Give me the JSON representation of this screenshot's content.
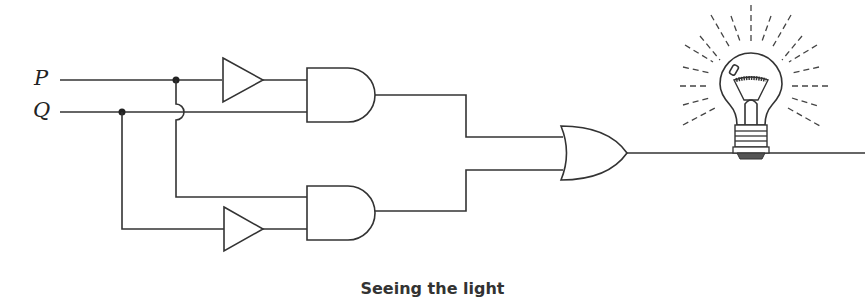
{
  "diagram": {
    "type": "logic-circuit",
    "inputs": [
      {
        "name": "P",
        "label": "P"
      },
      {
        "name": "Q",
        "label": "Q"
      }
    ],
    "gates": [
      {
        "id": "buf1",
        "type": "triangle (NOT/buffer)",
        "input": "P"
      },
      {
        "id": "and1",
        "type": "AND",
        "inputs": [
          "buf1",
          "Q"
        ]
      },
      {
        "id": "buf2",
        "type": "triangle (NOT/buffer)",
        "input": "Q"
      },
      {
        "id": "and2",
        "type": "AND",
        "inputs": [
          "P",
          "buf2"
        ]
      },
      {
        "id": "or1",
        "type": "OR",
        "inputs": [
          "and1",
          "and2"
        ]
      }
    ],
    "output": {
      "device": "light bulb",
      "state": "lit",
      "input": "or1"
    },
    "caption": "Seeing the light"
  },
  "colors": {
    "line": "#333333",
    "background": "#ffffff"
  }
}
